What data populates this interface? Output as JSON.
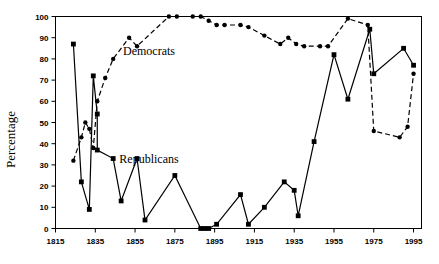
{
  "chart_data": {
    "type": "line",
    "title": "",
    "xlabel": "",
    "ylabel": "Percentage",
    "xlim": [
      1815,
      1999
    ],
    "ylim": [
      0,
      100
    ],
    "xticks": [
      1815,
      1835,
      1855,
      1875,
      1895,
      1915,
      1935,
      1955,
      1975,
      1995
    ],
    "yticks": [
      0,
      10,
      20,
      30,
      40,
      50,
      60,
      70,
      80,
      90,
      100
    ],
    "grid": false,
    "legend_position": "inline-annotations",
    "annotations": [
      {
        "text": "Democrats",
        "x": 1862,
        "y": 82
      },
      {
        "text": "Republicans",
        "x": 1862,
        "y": 31
      }
    ],
    "series": [
      {
        "name": "Democrats",
        "style": "dashed",
        "marker": "circle",
        "points": [
          {
            "x": 1824,
            "y": 32
          },
          {
            "x": 1828,
            "y": 43
          },
          {
            "x": 1830,
            "y": 50
          },
          {
            "x": 1832,
            "y": 47
          },
          {
            "x": 1834,
            "y": 38
          },
          {
            "x": 1836,
            "y": 60
          },
          {
            "x": 1840,
            "y": 71
          },
          {
            "x": 1844,
            "y": 80
          },
          {
            "x": 1852,
            "y": 90
          },
          {
            "x": 1856,
            "y": 86
          },
          {
            "x": 1872,
            "y": 100
          },
          {
            "x": 1876,
            "y": 100
          },
          {
            "x": 1884,
            "y": 100
          },
          {
            "x": 1888,
            "y": 100
          },
          {
            "x": 1892,
            "y": 98
          },
          {
            "x": 1896,
            "y": 96
          },
          {
            "x": 1900,
            "y": 96
          },
          {
            "x": 1908,
            "y": 96
          },
          {
            "x": 1912,
            "y": 95
          },
          {
            "x": 1920,
            "y": 91
          },
          {
            "x": 1928,
            "y": 87
          },
          {
            "x": 1932,
            "y": 90
          },
          {
            "x": 1936,
            "y": 87
          },
          {
            "x": 1940,
            "y": 86
          },
          {
            "x": 1948,
            "y": 86
          },
          {
            "x": 1952,
            "y": 86
          },
          {
            "x": 1962,
            "y": 99
          },
          {
            "x": 1972,
            "y": 96
          },
          {
            "x": 1975,
            "y": 46
          },
          {
            "x": 1988,
            "y": 43
          },
          {
            "x": 1992,
            "y": 48
          },
          {
            "x": 1995,
            "y": 73
          }
        ]
      },
      {
        "name": "Republicans",
        "style": "solid",
        "marker": "square",
        "points": [
          {
            "x": 1824,
            "y": 87
          },
          {
            "x": 1828,
            "y": 22
          },
          {
            "x": 1832,
            "y": 9
          },
          {
            "x": 1834,
            "y": 72
          },
          {
            "x": 1836,
            "y": 54
          },
          {
            "x": 1836,
            "y": 37
          },
          {
            "x": 1844,
            "y": 33
          },
          {
            "x": 1848,
            "y": 13
          },
          {
            "x": 1856,
            "y": 33
          },
          {
            "x": 1860,
            "y": 4
          },
          {
            "x": 1875,
            "y": 25
          },
          {
            "x": 1888,
            "y": 0
          },
          {
            "x": 1890,
            "y": 0
          },
          {
            "x": 1892,
            "y": 0
          },
          {
            "x": 1896,
            "y": 2
          },
          {
            "x": 1908,
            "y": 16
          },
          {
            "x": 1912,
            "y": 2
          },
          {
            "x": 1920,
            "y": 10
          },
          {
            "x": 1930,
            "y": 22
          },
          {
            "x": 1935,
            "y": 18
          },
          {
            "x": 1937,
            "y": 6
          },
          {
            "x": 1945,
            "y": 41
          },
          {
            "x": 1955,
            "y": 82
          },
          {
            "x": 1962,
            "y": 61
          },
          {
            "x": 1973,
            "y": 94
          },
          {
            "x": 1975,
            "y": 73
          },
          {
            "x": 1990,
            "y": 85
          },
          {
            "x": 1995,
            "y": 77
          }
        ]
      }
    ]
  },
  "corner": {
    "artifact_text": ""
  }
}
